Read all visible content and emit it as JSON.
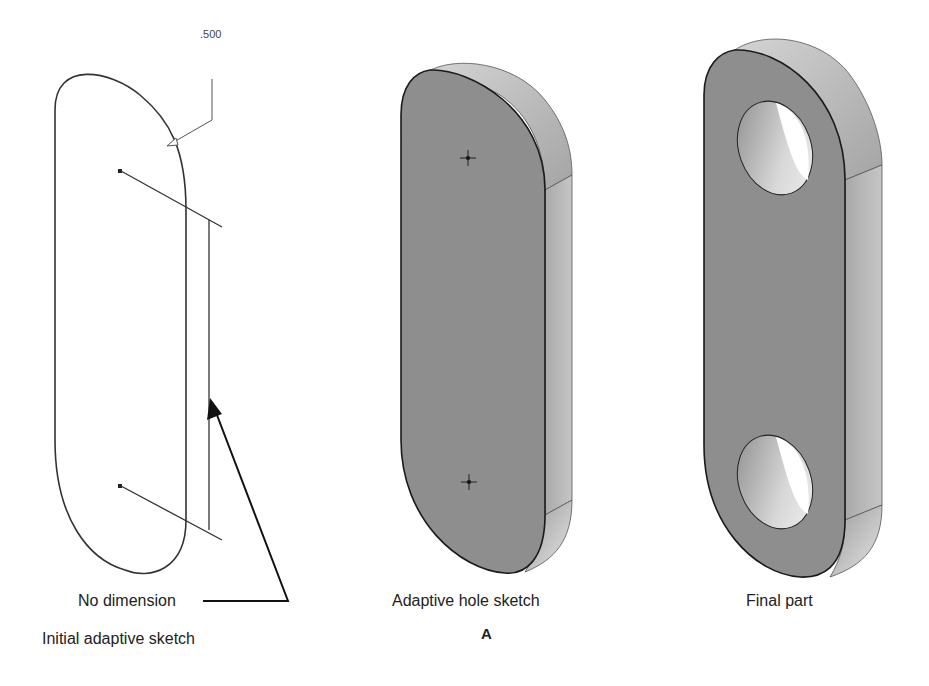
{
  "figure": {
    "panels": [
      {
        "id": "initial",
        "caption": "Initial adaptive sketch",
        "callout_label": "No dimension",
        "dimension_value": ".500"
      },
      {
        "id": "hole-sketch",
        "caption": "Adaptive hole sketch",
        "sublabel": "A"
      },
      {
        "id": "final",
        "caption": "Final part"
      }
    ],
    "colors": {
      "face": "#8e8e8e",
      "side": "#b8b8b8",
      "top": "#c8c8c8",
      "line": "#222222",
      "background": "#ffffff"
    }
  }
}
